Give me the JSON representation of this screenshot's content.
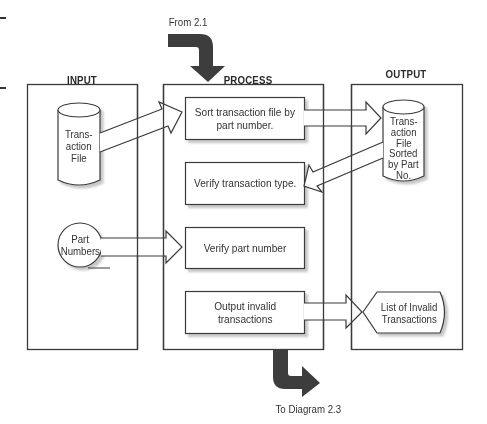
{
  "diagram": {
    "columns": {
      "input": {
        "title": "INPUT"
      },
      "process": {
        "title": "PROCESS"
      },
      "output": {
        "title": "OUTPUT"
      }
    },
    "connectors": {
      "incoming": "From 2.1",
      "outgoing": "To Diagram 2.3"
    },
    "inputs": {
      "transaction_file": {
        "shape": "cylinder",
        "lines": [
          "Trans-",
          "action",
          "File"
        ]
      },
      "part_numbers": {
        "shape": "circle",
        "lines": [
          "Part",
          "Numbers"
        ]
      }
    },
    "process_steps": [
      {
        "label": "Sort transaction file by part number.",
        "lines": [
          "Sort transaction file by",
          "part number."
        ]
      },
      {
        "label": "Verify transaction type.",
        "lines": [
          "Verify transaction type."
        ]
      },
      {
        "label": "Verify part number",
        "lines": [
          "Verify part number"
        ]
      },
      {
        "label": "Output invalid transactions",
        "lines": [
          "Output invalid",
          "transactions"
        ]
      }
    ],
    "outputs": {
      "sorted_file": {
        "shape": "cylinder",
        "lines": [
          "Trans-",
          "action",
          "File",
          "Sorted",
          "by Part",
          "No."
        ]
      },
      "invalid_list": {
        "shape": "display",
        "lines": [
          "List of Invalid",
          "Transactions"
        ]
      }
    },
    "flows": [
      {
        "from": "Transaction File",
        "to": "Sort transaction file by part number."
      },
      {
        "from": "Sort transaction file by part number.",
        "to": "Transaction File Sorted by Part No."
      },
      {
        "from": "Transaction File Sorted by Part No.",
        "to": "Verify transaction type."
      },
      {
        "from": "Part Numbers",
        "to": "Verify part number"
      },
      {
        "from": "Output invalid transactions",
        "to": "List of Invalid Transactions"
      }
    ],
    "colors": {
      "line": "#3a3a3a",
      "connector_arrow": "#3d3d3d",
      "shadow": "#cfcfcf",
      "background": "#ffffff"
    }
  }
}
